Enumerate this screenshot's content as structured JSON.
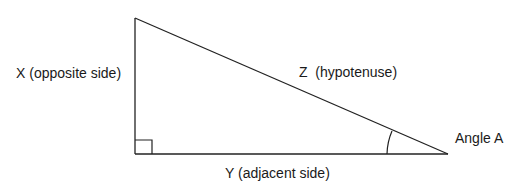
{
  "diagram": {
    "labels": {
      "opposite": "X (opposite side)",
      "hypotenuse": "Z  (hypotenuse)",
      "adjacent": "Y (adjacent side)",
      "angle": "Angle A"
    },
    "right_angle_marker": true,
    "line_color": "#222222"
  }
}
